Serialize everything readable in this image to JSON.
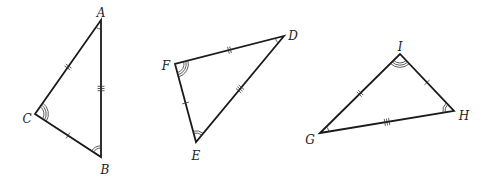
{
  "diagram": {
    "triangles": [
      {
        "name": "ABC",
        "vertices": {
          "A": {
            "x": 101,
            "y": 20,
            "label": "A",
            "lx": 101,
            "ly": 13
          },
          "B": {
            "x": 101,
            "y": 157,
            "label": "B",
            "lx": 105,
            "ly": 170
          },
          "C": {
            "x": 35,
            "y": 114,
            "label": "C",
            "lx": 27,
            "ly": 119
          }
        },
        "side_ticks": {
          "AC": 2,
          "AB": 3,
          "CB": 1
        },
        "angle_arcs": {
          "A": 1,
          "B": 2,
          "C": 3
        }
      },
      {
        "name": "DEF",
        "vertices": {
          "D": {
            "x": 284,
            "y": 36,
            "label": "D",
            "lx": 293,
            "ly": 36
          },
          "E": {
            "x": 196,
            "y": 142,
            "label": "E",
            "lx": 196,
            "ly": 156
          },
          "F": {
            "x": 175,
            "y": 64,
            "label": "F",
            "lx": 166,
            "ly": 66
          }
        },
        "side_ticks": {
          "FD": 2,
          "DE": 3,
          "FE": 1
        },
        "angle_arcs": {
          "D": 1,
          "E": 2,
          "F": 3
        }
      },
      {
        "name": "GHI",
        "vertices": {
          "G": {
            "x": 320,
            "y": 133,
            "label": "G",
            "lx": 310,
            "ly": 140
          },
          "H": {
            "x": 454,
            "y": 111,
            "label": "H",
            "lx": 464,
            "ly": 116
          },
          "I": {
            "x": 400,
            "y": 54,
            "label": "I",
            "lx": 400,
            "ly": 47
          }
        },
        "side_ticks": {
          "GI": 2,
          "GH": 3,
          "IH": 1
        },
        "angle_arcs": {
          "G": 1,
          "H": 2,
          "I": 3
        }
      }
    ]
  }
}
